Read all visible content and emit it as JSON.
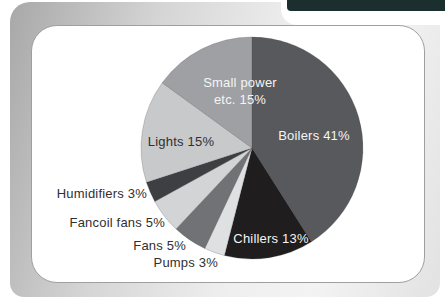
{
  "page": {
    "corner_tab_color": "#1b2f2e",
    "panel_border_color": "#9f9f9f"
  },
  "chart_data": {
    "type": "pie",
    "title": "",
    "legend": "none",
    "start_angle_deg": -90,
    "direction": "clockwise",
    "slices": [
      {
        "label": "Boilers",
        "value": 41,
        "color": "#57595c"
      },
      {
        "label": "Chillers",
        "value": 13,
        "color": "#201d1e"
      },
      {
        "label": "Pumps",
        "value": 3,
        "color": "#dfe0e2"
      },
      {
        "label": "Fans",
        "value": 5,
        "color": "#707275"
      },
      {
        "label": "Fancoil fans",
        "value": 5,
        "color": "#d3d4d6"
      },
      {
        "label": "Humidifiers",
        "value": 3,
        "color": "#3e3f42"
      },
      {
        "label": "Lights",
        "value": 15,
        "color": "#c7c9cb"
      },
      {
        "label": "Small power etc.",
        "value": 15,
        "color": "#9ea0a3"
      }
    ],
    "labels": {
      "small_power_line1": "Small power",
      "small_power_line2": "etc. 15%",
      "boilers": "Boilers 41%",
      "lights": "Lights 15%",
      "chillers": "Chillers 13%",
      "humidifiers": "Humidifiers 3%",
      "fancoil_fans": "Fancoil fans 5%",
      "fans": "Fans 5%",
      "pumps": "Pumps 3%"
    }
  }
}
